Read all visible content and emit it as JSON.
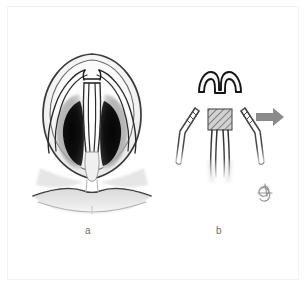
{
  "figure": {
    "domain": "medical-illustration",
    "background_color": "#ffffff",
    "frame_color": "#f2f2f2",
    "width": 307,
    "height": 287
  },
  "panels": [
    {
      "id": "a",
      "label": "a",
      "name": "nose-base-view",
      "description": "Base (worm's-eye) view of the nose showing nostrils, lower lateral cartilages, columella and upper lip",
      "parts": [
        {
          "name": "nasal-tip-outline",
          "color": "#3a3a3a"
        },
        {
          "name": "left-nostril",
          "color": "#0a0a0a"
        },
        {
          "name": "right-nostril",
          "color": "#0a0a0a"
        },
        {
          "name": "left-alar-shadow",
          "color": "#8f8f8f"
        },
        {
          "name": "right-alar-shadow",
          "color": "#8f8f8f"
        },
        {
          "name": "left-lateral-crus",
          "color": "#2b2b2b"
        },
        {
          "name": "right-lateral-crus",
          "color": "#2b2b2b"
        },
        {
          "name": "left-medial-crus",
          "color": "#2b2b2b"
        },
        {
          "name": "right-medial-crus",
          "color": "#2b2b2b"
        },
        {
          "name": "dome-segment",
          "color": "#1a1a1a"
        },
        {
          "name": "columella",
          "color": "#7a7a7a"
        },
        {
          "name": "upper-lip",
          "color": "#4a4a4a"
        },
        {
          "name": "philtrum",
          "color": "#9a9a9a"
        }
      ]
    },
    {
      "id": "b",
      "label": "b",
      "name": "divided-cartilage-components",
      "description": "The lower lateral cartilage complex separated into the excised dome arch segment, paired lateral crura and the medial crura with hatched graft block",
      "parts": [
        {
          "name": "excised-dome-arch",
          "color": "#1a1a1a"
        },
        {
          "name": "left-lateral-crus-strip",
          "color": "#4a4a4a"
        },
        {
          "name": "right-lateral-crus-strip",
          "color": "#4a4a4a"
        },
        {
          "name": "hatched-graft-block",
          "color": "#6a6a6a"
        },
        {
          "name": "medial-crura-strips",
          "color": "#3a3a3a"
        },
        {
          "name": "direction-arrow",
          "color": "#8a8a8a"
        },
        {
          "name": "artist-signature",
          "color": "#7a7a7a"
        }
      ]
    }
  ],
  "annotations": {
    "arrow": {
      "name": "direction-arrow",
      "direction": "right",
      "color": "#8a8a8a"
    },
    "signature": {
      "name": "artist-signature",
      "text": "JC",
      "color": "#7a7a7a"
    }
  },
  "colors": {
    "background": "#ffffff",
    "ink_dark": "#1a1a1a",
    "ink_mid": "#4a4a4a",
    "shadow_gray": "#8f8f8f",
    "nostril_black": "#0a0a0a",
    "arrow_gray": "#8a8a8a",
    "caption_gray": "#6e6e6e",
    "frame_gray": "#f2f2f2"
  }
}
